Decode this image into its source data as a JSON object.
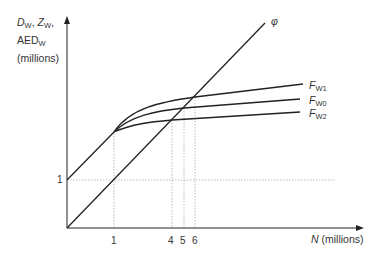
{
  "y_axis": {
    "label_line1_a": "D",
    "label_line1_a_sub": "W",
    "label_line1_sep": ", ",
    "label_line1_b": "Z",
    "label_line1_b_sub": "W",
    "label_line1_end": ",",
    "label_line2": "AED",
    "label_line2_sub": "W",
    "label_line3": "(millions)",
    "tick_1": "1"
  },
  "x_axis": {
    "label_var": "N",
    "label_unit": " (millions)",
    "ticks": [
      "1",
      "4",
      "5",
      "6"
    ]
  },
  "curves": {
    "phi_label": "φ",
    "fw1_label": "F",
    "fw1_sub": "W1",
    "fw0_label": "F",
    "fw0_sub": "W0",
    "fw2_label": "F",
    "fw2_sub": "W2"
  },
  "colors": {
    "line": "#222222",
    "guide": "#aaaaaa"
  }
}
